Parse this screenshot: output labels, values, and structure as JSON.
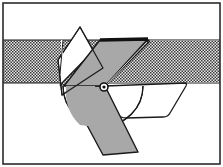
{
  "figure": {
    "canvas": {
      "width": 223,
      "height": 167
    },
    "colors": {
      "background": "#ffffff",
      "outline": "#1a1a1a",
      "gray_fill": "#a8a8a8",
      "hatch_dark": "#3d3d3d",
      "hatch_light": "#e8e8e8",
      "border": "#2b2b2b"
    }
  },
  "frame": {
    "name": "figure-border",
    "x": 3,
    "y": 3,
    "width": 217,
    "height": 161,
    "stroke_width": 1.6
  },
  "hatched_band": {
    "label": "workpiece-band",
    "x": 3,
    "y": 40,
    "width": 217,
    "height": 43,
    "pattern": "diagonal-crosshatch",
    "top_edge_y": 40,
    "bottom_edge_y": 83
  },
  "shapes": {
    "gray_blade_upper": {
      "label": "upper-gray-blade",
      "points": "100,40 147,40 105,86 66,86",
      "fill": "gray",
      "stroke_width": 1.3
    },
    "gray_blade_lower": {
      "label": "lower-gray-blade",
      "points": "66,86 105,86 138,152 103,155",
      "fill": "gray",
      "stroke_width": 1.3
    },
    "hatched_arm": {
      "label": "hatched-parallelogram-arm",
      "points": "103,41 149,40 105,85 60,85",
      "fill": "hatch",
      "stroke_width": 1.3
    },
    "white_triangle": {
      "label": "white-triangle-outline",
      "points": "80,27 103,68 62,95 58,60",
      "fill": "white",
      "stroke_width": 1.2
    },
    "bucket_outline": {
      "label": "bucket-trapezoid-outline",
      "points": "105,86 186,83 166,117 120,118",
      "fill": "none",
      "stroke_width": 1.3,
      "corner_radius": 7
    },
    "arc_outline": {
      "label": "pivot-arc-outline",
      "center_x": 103,
      "center_y": 86,
      "radius": 40,
      "stroke_width": 1.2
    },
    "thick_top_edge": {
      "label": "blade-top-thick-edge",
      "from_x": 100,
      "from_y": 40,
      "to_x": 148,
      "to_y": 39,
      "stroke_width": 3.4
    },
    "diagonal_link": {
      "label": "diagonal-link-line",
      "from_x": 105,
      "from_y": 86,
      "to_x": 150,
      "to_y": 41,
      "stroke_width": 1.3
    }
  },
  "pivot": {
    "label": "pivot-point",
    "cx": 104,
    "cy": 87,
    "outer_r": 4.0,
    "inner_r": 1.8
  }
}
